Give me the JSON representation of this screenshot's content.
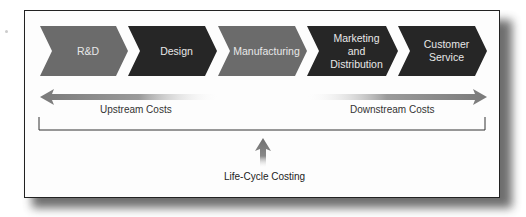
{
  "diagram": {
    "stages": [
      {
        "label": "R&D",
        "color": "#6b6b6b"
      },
      {
        "label": "Design",
        "color": "#262626"
      },
      {
        "label": "Manufacturing",
        "color": "#6b6b6b"
      },
      {
        "label": "Marketing\nand\nDistribution",
        "color": "#262626"
      },
      {
        "label": "Customer\nService",
        "color": "#262626"
      }
    ],
    "upstream_label": "Upstream Costs",
    "downstream_label": "Downstream Costs",
    "bottom_label": "Life-Cycle Costing",
    "colors": {
      "light_chevron": "#6b6b6b",
      "dark_chevron": "#262626",
      "arrow": "#7a7a7a",
      "frame_border": "#222222",
      "text": "#333333"
    }
  }
}
